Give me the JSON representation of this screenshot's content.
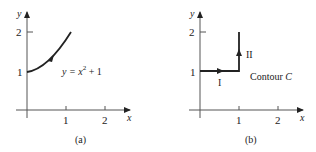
{
  "panels": [
    {
      "id": "a",
      "caption": "(a)",
      "x_axis_label": "x",
      "y_axis_label": "y",
      "x_ticks": [
        "1",
        "2"
      ],
      "y_ticks": [
        "1",
        "2"
      ],
      "curve_label_prefix": "y = x",
      "curve_label_exp": "2",
      "curve_label_suffix": " + 1",
      "curve": "y = x^2 + 1 from (0,1) to (1,2)"
    },
    {
      "id": "b",
      "caption": "(b)",
      "x_axis_label": "x",
      "y_axis_label": "y",
      "x_ticks": [
        "1",
        "2"
      ],
      "y_ticks": [
        "1",
        "2"
      ],
      "segment_1_label": "I",
      "segment_2_label": "II",
      "contour_label_prefix": "Contour ",
      "contour_label_var": "C",
      "path": "(0,1) -> (1,1) -> (1,2)"
    }
  ],
  "colors": {
    "ink": "#222222",
    "axis": "#555555"
  }
}
